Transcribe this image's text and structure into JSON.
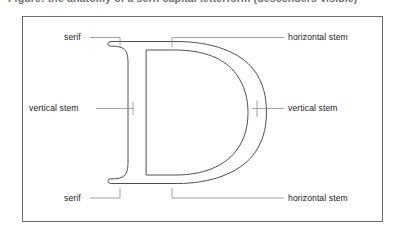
{
  "caption": {
    "clipped_text": "Figure: the anatomy of a serif capital letterform (descenders visible)"
  },
  "figure": {
    "letter": "D",
    "frame_color": "#6b6b6b",
    "stroke_color": "#3c3c3c",
    "leader_color": "#8a8a8a",
    "labels": [
      {
        "id": "serif-top",
        "text": "serif",
        "side": "left"
      },
      {
        "id": "horizontal-stem-top",
        "text": "horizontal stem",
        "side": "right"
      },
      {
        "id": "vertical-stem-left",
        "text": "vertical stem",
        "side": "left"
      },
      {
        "id": "vertical-stem-right",
        "text": "vertical stem",
        "side": "right"
      },
      {
        "id": "serif-bottom",
        "text": "serif",
        "side": "left"
      },
      {
        "id": "horizontal-stem-bottom",
        "text": "horizontal stem",
        "side": "right"
      }
    ]
  }
}
